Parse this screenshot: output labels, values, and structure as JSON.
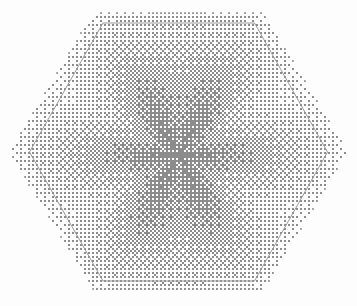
{
  "canvas": {
    "width": 357,
    "height": 306,
    "background_color": "#fdfdfd",
    "title": "Hexagonal Radial Dither Pattern"
  },
  "chart_data": {
    "type": "heatmap",
    "title": "Hexagonal Radial Dither Pattern",
    "subtitle": "",
    "xlabel": "",
    "ylabel": "",
    "grid": false,
    "legend": "none",
    "xlim": [
      0,
      357
    ],
    "ylim": [
      0,
      306
    ],
    "field": {
      "model": "radial-falloff-with-spokes",
      "center": [
        178,
        155
      ],
      "peak_intensity": 0.62,
      "edge_intensity": 0.06,
      "falloff_exponent": 0.85,
      "spoke_count": 6,
      "spoke_amplitude": 0.14,
      "vertical_band_amplitude": 0.18,
      "vertical_band_width": 26
    },
    "dither": {
      "method": "bayer-ordered",
      "matrix_size": 4,
      "cell_pixels": 2,
      "ink_color": "#8c8c8c"
    }
  },
  "shapes": {
    "outer_hexagon": {
      "name": "outer-hexagon",
      "orientation": "pointy-side",
      "center": [
        178.5,
        151.5
      ],
      "radius_x": 170,
      "radius_y": 139,
      "vertices": [
        [
          8.5,
          151.5
        ],
        [
          93.5,
          12.5
        ],
        [
          263.5,
          12.5
        ],
        [
          348.5,
          151.5
        ],
        [
          263.5,
          290.5
        ],
        [
          93.5,
          290.5
        ]
      ],
      "fill": "dither-pattern",
      "stroke": "none",
      "stroke_width": 0
    },
    "inner_hexagon": {
      "name": "inner-hexagon",
      "orientation": "pointy-side",
      "center": [
        178.5,
        152.0
      ],
      "radius_x": 149,
      "radius_y": 129,
      "vertices": [
        [
          29.5,
          152.0
        ],
        [
          103.0,
          23.0
        ],
        [
          254.5,
          23.0
        ],
        [
          327.5,
          152.0
        ],
        [
          254.5,
          281.0
        ],
        [
          103.0,
          281.0
        ]
      ],
      "fill": "none",
      "stroke": "#9a9a9a",
      "stroke_width": 1
    }
  },
  "colors": {
    "background": "#fdfdfd",
    "ink": "#8c8c8c",
    "inner_outline": "#9a9a9a",
    "outer_outline": "none"
  }
}
